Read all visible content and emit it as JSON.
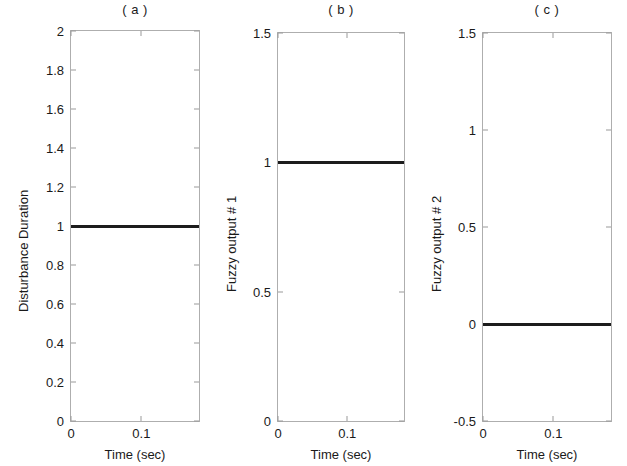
{
  "figure": {
    "background": "#ffffff",
    "axis_color": "#aeaeae",
    "line_color": "#1c1c1c"
  },
  "chart_data": [
    {
      "type": "line",
      "panel_id": "a",
      "title": "( a )",
      "xlabel": "Time (sec)",
      "ylabel": "Disturbance Duration",
      "xlim": [
        0,
        0.182
      ],
      "ylim": [
        0,
        2
      ],
      "xticks": [
        0,
        0.1
      ],
      "xticklabels": [
        "0",
        "0.1"
      ],
      "yticks": [
        0,
        0.2,
        0.4,
        0.6,
        0.8,
        1,
        1.2,
        1.4,
        1.6,
        1.8,
        2
      ],
      "yticklabels": [
        "0",
        "0.2",
        "0.4",
        "0.6",
        "0.8",
        "1",
        "1.2",
        "1.4",
        "1.6",
        "1.8",
        "2"
      ],
      "grid": false,
      "legend": null,
      "series": [
        {
          "name": "Disturbance Duration",
          "color": "#1c1c1c",
          "x": [
            0,
            0.02,
            0.04,
            0.06,
            0.08,
            0.1,
            0.12,
            0.14,
            0.16,
            0.182
          ],
          "values": [
            1,
            1,
            1,
            1,
            1,
            1,
            1,
            1,
            1,
            1
          ]
        }
      ]
    },
    {
      "type": "line",
      "panel_id": "b",
      "title": "( b )",
      "xlabel": "Time (sec)",
      "ylabel": "Fuzzy output # 1",
      "xlim": [
        0,
        0.182
      ],
      "ylim": [
        0,
        1.5
      ],
      "xticks": [
        0,
        0.1
      ],
      "xticklabels": [
        "0",
        "0.1"
      ],
      "yticks": [
        0,
        0.5,
        1,
        1.5
      ],
      "yticklabels": [
        "0",
        "0.5",
        "1",
        "1.5"
      ],
      "grid": false,
      "legend": null,
      "series": [
        {
          "name": "Fuzzy output # 1",
          "color": "#1c1c1c",
          "x": [
            0,
            0.02,
            0.04,
            0.06,
            0.08,
            0.1,
            0.12,
            0.14,
            0.16,
            0.182
          ],
          "values": [
            1,
            1,
            1,
            1,
            1,
            1,
            1,
            1,
            1,
            1
          ]
        }
      ]
    },
    {
      "type": "line",
      "panel_id": "c",
      "title": "( c )",
      "xlabel": "Time (sec)",
      "ylabel": "Fuzzy output # 2",
      "xlim": [
        0,
        0.182
      ],
      "ylim": [
        -0.5,
        1.5
      ],
      "xticks": [
        0,
        0.1
      ],
      "xticklabels": [
        "0",
        "0.1"
      ],
      "yticks": [
        -0.5,
        0,
        0.5,
        1,
        1.5
      ],
      "yticklabels": [
        "-0.5",
        "0",
        "0.5",
        "1",
        "1.5"
      ],
      "grid": false,
      "legend": null,
      "series": [
        {
          "name": "Fuzzy output # 2",
          "color": "#1c1c1c",
          "x": [
            0,
            0.02,
            0.04,
            0.06,
            0.08,
            0.1,
            0.12,
            0.14,
            0.16,
            0.182
          ],
          "values": [
            0,
            0,
            0,
            0,
            0,
            0,
            0,
            0,
            0,
            0
          ]
        }
      ]
    }
  ]
}
